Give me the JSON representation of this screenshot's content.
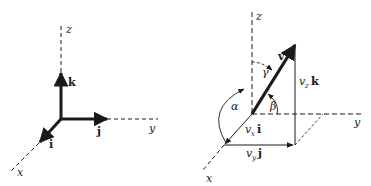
{
  "left_diagram": {
    "axes": {
      "x": "x",
      "y": "y",
      "z": "z"
    },
    "unit_vectors": {
      "i": "i",
      "j": "j",
      "k": "k"
    }
  },
  "right_diagram": {
    "axes": {
      "x": "x",
      "y": "y",
      "z": "z"
    },
    "vector": "v",
    "angles": {
      "alpha": "α",
      "beta": "β",
      "gamma": "γ"
    },
    "components": {
      "vx": {
        "coef": "v",
        "sub": "x",
        "unit": "i"
      },
      "vy": {
        "coef": "v",
        "sub": "y",
        "unit": "j"
      },
      "vz": {
        "coef": "v",
        "sub": "z",
        "unit": "k"
      }
    }
  },
  "colors": {
    "ink": "#1a1a1a",
    "background": "#ffffff"
  }
}
